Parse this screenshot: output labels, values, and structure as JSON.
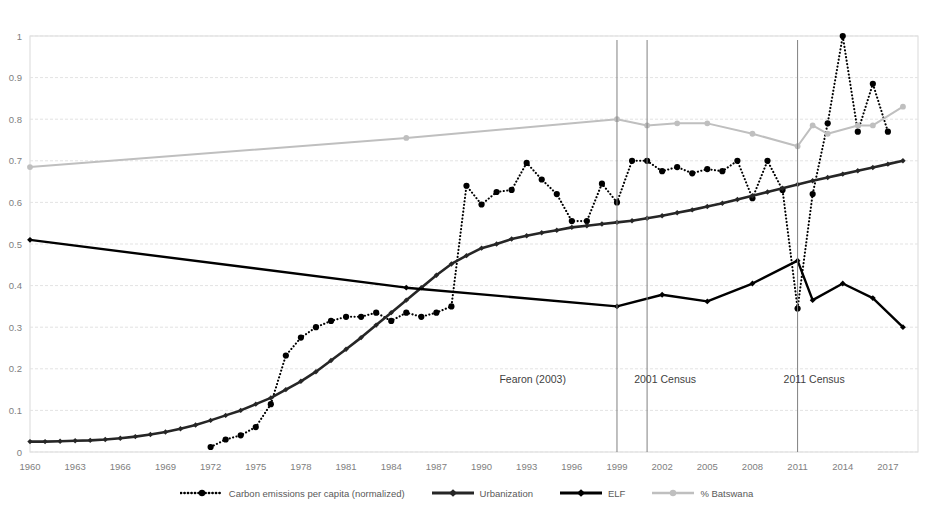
{
  "chart_data": {
    "type": "line",
    "title": "",
    "xlabel": "",
    "ylabel": "",
    "xlim": [
      1960,
      2019
    ],
    "ylim": [
      0,
      1
    ],
    "ytick_labels": [
      "0",
      "0.1",
      "0.2",
      "0.3",
      "0.4",
      "0.5",
      "0.6",
      "0.7",
      "0.8",
      "0.9",
      "1"
    ],
    "ytick_values": [
      0,
      0.1,
      0.2,
      0.3,
      0.4,
      0.5,
      0.6,
      0.7,
      0.8,
      0.9,
      1
    ],
    "xtick_labels": [
      "1960",
      "1963",
      "1966",
      "1969",
      "1972",
      "1975",
      "1978",
      "1981",
      "1984",
      "1987",
      "1990",
      "1993",
      "1996",
      "1999",
      "2002",
      "2005",
      "2008",
      "2011",
      "2014",
      "2017"
    ],
    "xtick_values": [
      1960,
      1963,
      1966,
      1969,
      1972,
      1975,
      1978,
      1981,
      1984,
      1987,
      1990,
      1993,
      1996,
      1999,
      2002,
      2005,
      2008,
      2011,
      2014,
      2017
    ],
    "grid": true,
    "legend_position": "bottom",
    "series": [
      {
        "name": "Carbon emissions per capita (normalized)",
        "style": "dotted",
        "color": "#000000",
        "marker": "circle",
        "x": [
          1972,
          1973,
          1974,
          1975,
          1976,
          1977,
          1978,
          1979,
          1980,
          1981,
          1982,
          1983,
          1984,
          1985,
          1986,
          1987,
          1988,
          1989,
          1990,
          1991,
          1992,
          1993,
          1994,
          1995,
          1996,
          1997,
          1998,
          1999,
          2000,
          2001,
          2002,
          2003,
          2004,
          2005,
          2006,
          2007,
          2008,
          2009,
          2010,
          2011,
          2012,
          2013,
          2014,
          2015,
          2016,
          2017
        ],
        "y": [
          0.012,
          0.03,
          0.04,
          0.06,
          0.115,
          0.232,
          0.275,
          0.3,
          0.315,
          0.325,
          0.325,
          0.335,
          0.315,
          0.335,
          0.325,
          0.335,
          0.35,
          0.64,
          0.595,
          0.625,
          0.63,
          0.695,
          0.655,
          0.62,
          0.555,
          0.555,
          0.645,
          0.6,
          0.7,
          0.7,
          0.675,
          0.685,
          0.67,
          0.68,
          0.675,
          0.7,
          0.61,
          0.7,
          0.63,
          0.345,
          0.62,
          0.79,
          1.0,
          0.77,
          0.885,
          0.77
        ]
      },
      {
        "name": "Urbanization",
        "style": "solid",
        "color": "#262626",
        "marker": "diamond",
        "x": [
          1960,
          1961,
          1962,
          1963,
          1964,
          1965,
          1966,
          1967,
          1968,
          1969,
          1970,
          1971,
          1972,
          1973,
          1974,
          1975,
          1976,
          1977,
          1978,
          1979,
          1980,
          1981,
          1982,
          1983,
          1984,
          1985,
          1986,
          1987,
          1988,
          1989,
          1990,
          1991,
          1992,
          1993,
          1994,
          1995,
          1996,
          1997,
          1998,
          1999,
          2000,
          2001,
          2002,
          2003,
          2004,
          2005,
          2006,
          2007,
          2008,
          2009,
          2010,
          2011,
          2012,
          2013,
          2014,
          2015,
          2016,
          2017,
          2018
        ],
        "y": [
          0.025,
          0.025,
          0.026,
          0.027,
          0.028,
          0.03,
          0.033,
          0.037,
          0.042,
          0.048,
          0.056,
          0.065,
          0.076,
          0.088,
          0.1,
          0.115,
          0.13,
          0.15,
          0.17,
          0.193,
          0.22,
          0.247,
          0.275,
          0.305,
          0.335,
          0.365,
          0.395,
          0.425,
          0.452,
          0.472,
          0.49,
          0.5,
          0.512,
          0.52,
          0.527,
          0.533,
          0.54,
          0.544,
          0.548,
          0.552,
          0.556,
          0.562,
          0.568,
          0.575,
          0.582,
          0.59,
          0.598,
          0.607,
          0.616,
          0.625,
          0.634,
          0.643,
          0.652,
          0.66,
          0.668,
          0.676,
          0.684,
          0.692,
          0.7
        ]
      },
      {
        "name": "ELF",
        "style": "solid",
        "color": "#000000",
        "marker": "diamond",
        "x": [
          1960,
          1985,
          1999,
          2002,
          2005,
          2008,
          2011,
          2012,
          2014,
          2016,
          2018
        ],
        "y": [
          0.51,
          0.395,
          0.35,
          0.378,
          0.362,
          0.405,
          0.46,
          0.365,
          0.405,
          0.37,
          0.3
        ]
      },
      {
        "name": "% Batswana",
        "style": "solid",
        "color": "#bfbfbf",
        "marker": "circle",
        "x": [
          1960,
          1985,
          1999,
          2001,
          2003,
          2005,
          2008,
          2011,
          2012,
          2013,
          2015,
          2016,
          2018
        ],
        "y": [
          0.685,
          0.755,
          0.8,
          0.785,
          0.79,
          0.79,
          0.765,
          0.735,
          0.785,
          0.765,
          0.785,
          0.785,
          0.83
        ]
      }
    ],
    "annotations": [
      {
        "label": "Fearon (2003)",
        "x": 1999,
        "label_x": 1993.4,
        "label_y": 0.165
      },
      {
        "label": "2001 Census",
        "x": 2001,
        "label_x": 2002.2,
        "label_y": 0.165
      },
      {
        "label": "2011 Census",
        "x": 2011,
        "label_x": 2012.1,
        "label_y": 0.165
      }
    ]
  },
  "legend": {
    "items": [
      {
        "label": "Carbon emissions per capita (normalized)",
        "swatch": "dotted-marker-swatch"
      },
      {
        "label": "Urbanization",
        "swatch": "solid-thick-marker-swatch"
      },
      {
        "label": "ELF",
        "swatch": "solid-marker-swatch"
      },
      {
        "label": "% Batswana",
        "swatch": "solid-grey-marker-swatch"
      }
    ]
  }
}
